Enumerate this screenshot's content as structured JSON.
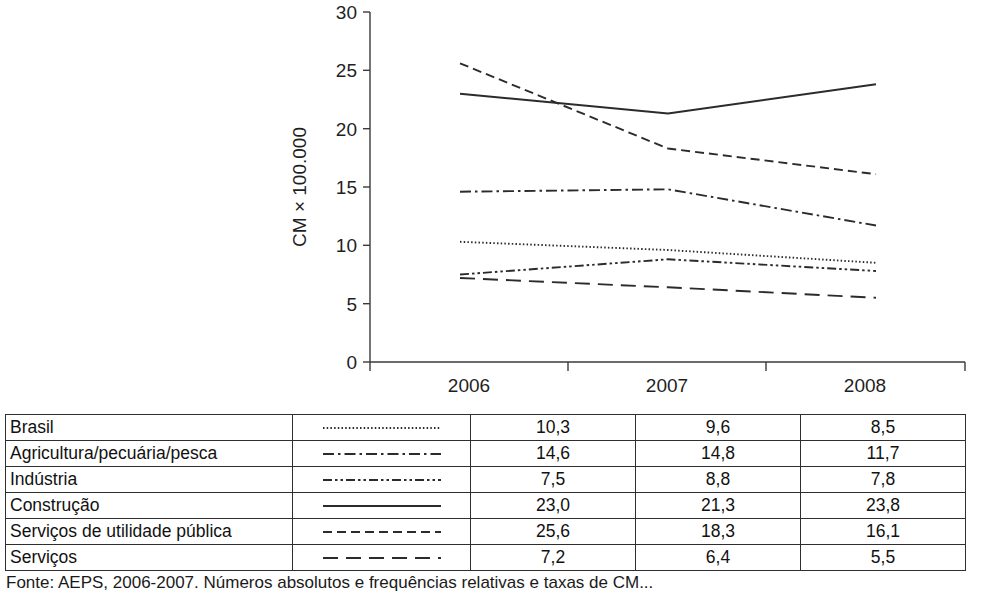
{
  "chart_data": {
    "type": "line",
    "title": "",
    "xlabel": "",
    "ylabel": "CM × 100.000",
    "categories": [
      "2006",
      "2007",
      "2008"
    ],
    "x": [
      2006,
      2007,
      2008
    ],
    "ylim": [
      0,
      30
    ],
    "yticks": [
      0,
      5,
      10,
      15,
      20,
      25,
      30
    ],
    "ytick_labels": [
      "0",
      "5",
      "10",
      "15",
      "20",
      "25",
      "30"
    ],
    "grid": false,
    "legend_position": "table-below",
    "series": [
      {
        "name": "Brasil",
        "values": [
          10.3,
          9.6,
          8.5
        ],
        "display_values": [
          "10,3",
          "9,6",
          "8,5"
        ],
        "dash": "dotted",
        "dasharray": "1.5 2.2"
      },
      {
        "name": "Agricultura/pecuária/pesca",
        "values": [
          14.6,
          14.8,
          11.7
        ],
        "display_values": [
          "14,6",
          "14,8",
          "11,7"
        ],
        "dash": "dash-dot",
        "dasharray": "11 4 2.5 4"
      },
      {
        "name": "Indústria",
        "values": [
          7.5,
          8.8,
          7.8
        ],
        "display_values": [
          "7,5",
          "8,8",
          "7,8"
        ],
        "dash": "dash-dot-dot",
        "dasharray": "9 3 2.5 3 2.5 3"
      },
      {
        "name": "Construção",
        "values": [
          23.0,
          21.3,
          23.8
        ],
        "display_values": [
          "23,0",
          "21,3",
          "23,8"
        ],
        "dash": "solid",
        "dasharray": "none"
      },
      {
        "name": "Serviços de utilidade pública",
        "values": [
          25.6,
          18.3,
          16.1
        ],
        "display_values": [
          "25,6",
          "18,3",
          "16,1"
        ],
        "dash": "dashed",
        "dasharray": "9 5"
      },
      {
        "name": "Serviços",
        "values": [
          7.2,
          6.4,
          5.5
        ],
        "display_values": [
          "7,2",
          "6,4",
          "5,5"
        ],
        "dash": "long-dash",
        "dasharray": "15 8"
      }
    ]
  },
  "axis": {
    "y_title": "CM × 100.000",
    "y_ticks": [
      "30",
      "25",
      "20",
      "15",
      "10",
      "5",
      "0"
    ],
    "x_ticks": [
      "2006",
      "2007",
      "2008"
    ]
  },
  "table": {
    "rows": [
      {
        "label": "Brasil",
        "v2006": "10,3",
        "v2007": "9,6",
        "v2008": "8,5"
      },
      {
        "label": "Agricultura/pecuária/pesca",
        "v2006": "14,6",
        "v2007": "14,8",
        "v2008": "11,7"
      },
      {
        "label": "Indústria",
        "v2006": "7,5",
        "v2007": "8,8",
        "v2008": "7,8"
      },
      {
        "label": "Construção",
        "v2006": "23,0",
        "v2007": "21,3",
        "v2008": "23,8"
      },
      {
        "label": "Serviços de utilidade pública",
        "v2006": "25,6",
        "v2007": "18,3",
        "v2008": "16,1"
      },
      {
        "label": "Serviços",
        "v2006": "7,2",
        "v2007": "6,4",
        "v2008": "5,5"
      }
    ]
  },
  "footer": {
    "source_note": "Fonte: AEPS, 2006-2007. Números absolutos e frequências relativas e taxas de CM..."
  },
  "colors": {
    "line": "#2b2b2b",
    "axis": "#3a3a3a",
    "border": "#2e2e2e",
    "text": "#1a1a1a"
  }
}
